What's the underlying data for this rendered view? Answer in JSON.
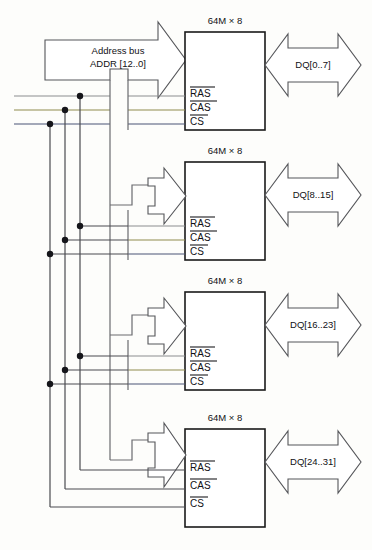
{
  "diagram": {
    "background_color": "#fdfdfb",
    "chip_border_color": "#1a1a1a",
    "arrow_outline_color": "#55565a",
    "wire_color": "#6a6b6f",
    "junction_dot_color": "#15151a"
  },
  "address_bus": {
    "label_line1": "Address bus",
    "label_line2": "ADDR [12..0]",
    "arrow_direction": "right",
    "arrow_style": "block-arrow"
  },
  "control_buses": [
    {
      "name": "RAS",
      "signal_label": "RAS",
      "overline": true,
      "color": "#8c8d90",
      "y": 96
    },
    {
      "name": "CAS",
      "signal_label": "CAS",
      "overline": true,
      "color": "#8f8b4e",
      "y": 110
    },
    {
      "name": "CS",
      "signal_label": "CS",
      "overline": true,
      "color": "#4a5577",
      "y": 124
    }
  ],
  "chips": [
    {
      "title": "64M × 8",
      "data_label": "DQ[0..7]",
      "signals": [
        "RAS",
        "CAS",
        "CS"
      ],
      "address_port": "ADDR [12..0]"
    },
    {
      "title": "64M × 8",
      "data_label": "DQ[8..15]",
      "signals": [
        "RAS",
        "CAS",
        "CS"
      ],
      "address_port": "ADDR [12..0]"
    },
    {
      "title": "64M × 8",
      "data_label": "DQ[16..23]",
      "signals": [
        "RAS",
        "CAS",
        "CS"
      ],
      "address_port": "ADDR [12..0]"
    },
    {
      "title": "64M × 8",
      "data_label": "DQ[24..31]",
      "signals": [
        "RAS",
        "CAS",
        "CS"
      ],
      "address_port": "ADDR [12..0]"
    }
  ],
  "data_arrow": {
    "direction": "bidirectional",
    "style": "double-block-arrow"
  }
}
